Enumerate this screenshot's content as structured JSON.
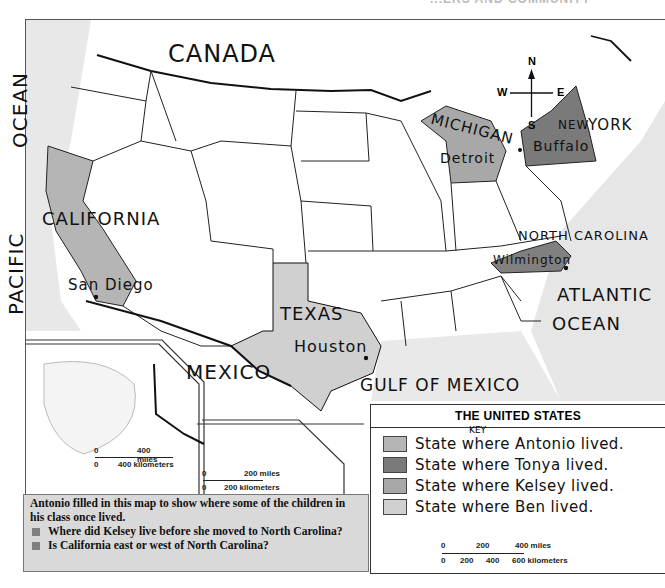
{
  "page_header_fragment": "...ERS AND COMMUNITY",
  "map": {
    "labels": {
      "canada": "CANADA",
      "pacific_ocean_1": "OCEAN",
      "pacific_ocean_2": "PACIFIC",
      "california": "CALIFORNIA",
      "san_diego": "San Diego",
      "texas": "TEXAS",
      "houston": "Houston",
      "mexico": "MEXICO",
      "gulf_of_mexico": "GULF OF MEXICO",
      "michigan": "MICHIGAN",
      "detroit": "Detroit",
      "new": "NEW",
      "york": "YORK",
      "buffalo": "Buffalo",
      "north_carolina": "NORTH CAROLINA",
      "wilmington": "Wilmington",
      "atlantic": "ATLANTIC",
      "ocean": "OCEAN"
    },
    "compass": {
      "n": "N",
      "s": "S",
      "e": "E",
      "w": "W"
    },
    "alaska_inset_scale": {
      "zero_top": "0",
      "miles": "400 miles",
      "zero_bottom": "0",
      "km": "400 kilometers"
    },
    "hawaii_inset_scale": {
      "zero_top": "0",
      "miles": "200 miles",
      "zero_bottom": "0",
      "km": "200 kilometers"
    },
    "colors": {
      "antonio": "#b5b5b5",
      "tonya": "#7a7a7a",
      "kelsey": "#a8a8a8",
      "ben": "#d0d0d0",
      "ocean": "#e6e6e6"
    }
  },
  "key": {
    "title": "THE UNITED STATES",
    "annotation": "KEY",
    "items": [
      {
        "label": "State where Antonio lived."
      },
      {
        "label": "State where Tonya lived."
      },
      {
        "label": "State where Kelsey lived."
      },
      {
        "label": "State where Ben lived."
      }
    ],
    "scale": {
      "miles_ticks": [
        "0",
        "200",
        "400 miles"
      ],
      "km_ticks": [
        "0",
        "200",
        "400",
        "600 kilometers"
      ]
    }
  },
  "caption": {
    "intro": "Antonio filled in this map to show where some of the children in his class once lived.",
    "questions": [
      "Where did Kelsey live before she moved to North Carolina?",
      "Is California east or west of North Carolina?"
    ]
  }
}
